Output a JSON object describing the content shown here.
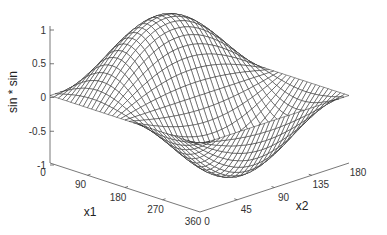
{
  "chart_data": {
    "type": "surface",
    "title": "",
    "function": "sin(x1) * sin(x2)",
    "xlabel": "x1",
    "ylabel": "x2",
    "zlabel": "sin * sin",
    "x1_range": [
      0,
      360
    ],
    "x2_range": [
      0,
      180
    ],
    "zlim": [
      -1,
      1
    ],
    "x1_ticks": [
      "0",
      "90",
      "180",
      "270",
      "360"
    ],
    "x2_ticks": [
      "0",
      "45",
      "90",
      "135",
      "180"
    ],
    "z_ticks": [
      "1",
      "0.5",
      "0",
      "-0.5",
      "-1"
    ],
    "mesh_resolution": {
      "x1_steps": 36,
      "x2_steps": 30
    },
    "style": "wireframe mesh, black lines on white faces",
    "grid": false,
    "legend": "none",
    "peak": {
      "x1": 90,
      "x2": 90,
      "z": 1
    },
    "trough": {
      "x1": 270,
      "x2": 90,
      "z": -1
    }
  },
  "colors": {
    "mesh_line": "#222222",
    "face": "#ffffff",
    "axis": "#555555",
    "text": "#333333"
  }
}
